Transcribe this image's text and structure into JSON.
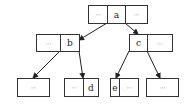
{
  "diagram": {
    "type": "tree",
    "nodes": [
      {
        "id": "root",
        "cells": [
          "···",
          "a",
          "···"
        ]
      },
      {
        "id": "b",
        "cells": [
          "···",
          "b"
        ]
      },
      {
        "id": "c",
        "cells": [
          "c",
          "···"
        ]
      },
      {
        "id": "leaf1",
        "cells": [
          "···"
        ]
      },
      {
        "id": "d",
        "cells": [
          "···",
          "d"
        ]
      },
      {
        "id": "e",
        "cells": [
          "e",
          "···"
        ]
      },
      {
        "id": "leaf4",
        "cells": [
          "···"
        ]
      }
    ],
    "edges": [
      {
        "from": "root",
        "to": "b"
      },
      {
        "from": "root",
        "to": "c"
      },
      {
        "from": "b",
        "to": "leaf1"
      },
      {
        "from": "b",
        "to": "d"
      },
      {
        "from": "c",
        "to": "e"
      },
      {
        "from": "c",
        "to": "leaf4"
      }
    ]
  }
}
